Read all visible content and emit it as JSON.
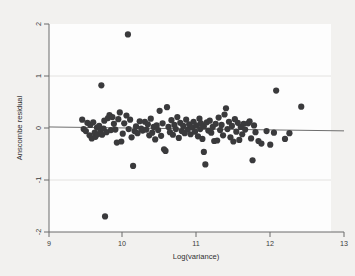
{
  "chart_data": {
    "type": "scatter",
    "title": "",
    "subtitle": "",
    "xlabel": "Log(variance)",
    "ylabel": "Anscombe residual",
    "xlim": [
      9,
      13
    ],
    "ylim": [
      -2,
      2
    ],
    "xticks": [
      9,
      10,
      11,
      12,
      13
    ],
    "xtick_labels": [
      "9",
      "10",
      "11",
      "12",
      "13"
    ],
    "yticks": [
      -2,
      -1,
      0,
      1,
      2
    ],
    "ytick_labels": [
      "-2",
      "-1",
      "0",
      "1",
      "2"
    ],
    "grid": "horizontal-faint",
    "legend": "none",
    "legend_position": "none",
    "marker": {
      "shape": "circle",
      "color": "#3a3a3c",
      "size": 3.1
    },
    "reference_line": {
      "type": "line",
      "color": "#6e6e6e",
      "x": [
        9.0,
        13.0
      ],
      "y": [
        0.02,
        -0.055
      ]
    },
    "series": [
      {
        "name": "Anscombe residuals",
        "n": 132,
        "points": [
          [
            9.45,
            0.16
          ],
          [
            9.47,
            -0.02
          ],
          [
            9.5,
            -0.06
          ],
          [
            9.52,
            0.1
          ],
          [
            9.55,
            -0.14
          ],
          [
            9.56,
            0.06
          ],
          [
            9.58,
            -0.2
          ],
          [
            9.6,
            0.11
          ],
          [
            9.62,
            -0.09
          ],
          [
            9.63,
            -0.17
          ],
          [
            9.65,
            0.01
          ],
          [
            9.66,
            -0.12
          ],
          [
            9.68,
            0.04
          ],
          [
            9.7,
            -0.05
          ],
          [
            9.71,
            0.82
          ],
          [
            9.72,
            -0.13
          ],
          [
            9.74,
            -0.01
          ],
          [
            9.75,
            0.14
          ],
          [
            9.76,
            -1.7
          ],
          [
            9.78,
            -0.08
          ],
          [
            9.8,
            0.19
          ],
          [
            9.82,
            0.25
          ],
          [
            9.84,
            -0.04
          ],
          [
            9.86,
            0.21
          ],
          [
            9.88,
            0.08
          ],
          [
            9.9,
            -0.03
          ],
          [
            9.92,
            -0.28
          ],
          [
            9.94,
            0.17
          ],
          [
            9.96,
            0.3
          ],
          [
            9.98,
            -0.26
          ],
          [
            10.0,
            -0.11
          ],
          [
            10.02,
            0.09
          ],
          [
            10.05,
            0.24
          ],
          [
            10.07,
            1.8
          ],
          [
            10.08,
            -0.02
          ],
          [
            10.1,
            0.16
          ],
          [
            10.12,
            -0.18
          ],
          [
            10.14,
            -0.73
          ],
          [
            10.16,
            -0.06
          ],
          [
            10.18,
            0.03
          ],
          [
            10.2,
            -0.1
          ],
          [
            10.23,
            0.13
          ],
          [
            10.25,
            -0.01
          ],
          [
            10.27,
            -0.05
          ],
          [
            10.3,
            0.12
          ],
          [
            10.32,
            -0.03
          ],
          [
            10.34,
            0.07
          ],
          [
            10.36,
            -0.14
          ],
          [
            10.38,
            0.18
          ],
          [
            10.4,
            -0.09
          ],
          [
            10.42,
            0.02
          ],
          [
            10.44,
            -0.22
          ],
          [
            10.46,
            0.05
          ],
          [
            10.48,
            -0.04
          ],
          [
            10.5,
            0.33
          ],
          [
            10.52,
            -0.15
          ],
          [
            10.54,
            0.09
          ],
          [
            10.56,
            -0.41
          ],
          [
            10.58,
            -0.44
          ],
          [
            10.6,
            0.4
          ],
          [
            10.62,
            0.02
          ],
          [
            10.64,
            -0.08
          ],
          [
            10.66,
            0.15
          ],
          [
            10.68,
            -0.13
          ],
          [
            10.7,
            0.06
          ],
          [
            10.72,
            -0.02
          ],
          [
            10.74,
            0.21
          ],
          [
            10.76,
            -0.19
          ],
          [
            10.78,
            0.1
          ],
          [
            10.8,
            -0.06
          ],
          [
            10.82,
            0.04
          ],
          [
            10.84,
            -0.1
          ],
          [
            10.86,
            0.16
          ],
          [
            10.88,
            -0.03
          ],
          [
            10.9,
            0.07
          ],
          [
            10.92,
            -0.12
          ],
          [
            10.94,
            0.01
          ],
          [
            10.96,
            0.12
          ],
          [
            10.98,
            -0.07
          ],
          [
            11.0,
            0.05
          ],
          [
            11.02,
            -0.16
          ],
          [
            11.04,
            0.18
          ],
          [
            11.05,
            -0.02
          ],
          [
            11.06,
            0.09
          ],
          [
            11.08,
            -0.21
          ],
          [
            11.1,
            0.03
          ],
          [
            11.1,
            -0.46
          ],
          [
            11.12,
            -0.7
          ],
          [
            11.14,
            0.11
          ],
          [
            11.16,
            -0.05
          ],
          [
            11.18,
            0.14
          ],
          [
            11.2,
            -0.09
          ],
          [
            11.22,
            0.02
          ],
          [
            11.24,
            -0.25
          ],
          [
            11.26,
            0.08
          ],
          [
            11.28,
            -0.24
          ],
          [
            11.3,
            0.2
          ],
          [
            11.32,
            -0.04
          ],
          [
            11.34,
            0.06
          ],
          [
            11.36,
            -0.14
          ],
          [
            11.38,
            0.26
          ],
          [
            11.4,
            0.38
          ],
          [
            11.42,
            -0.02
          ],
          [
            11.44,
            0.12
          ],
          [
            11.46,
            -0.18
          ],
          [
            11.48,
            0.04
          ],
          [
            11.5,
            -0.26
          ],
          [
            11.52,
            0.17
          ],
          [
            11.54,
            -0.07
          ],
          [
            11.56,
            0.1
          ],
          [
            11.58,
            -0.23
          ],
          [
            11.6,
            0.02
          ],
          [
            11.62,
            -0.12
          ],
          [
            11.64,
            0.08
          ],
          [
            11.66,
            -0.03
          ],
          [
            11.7,
            0.09
          ],
          [
            11.72,
            0.13
          ],
          [
            11.74,
            -0.2
          ],
          [
            11.76,
            -0.62
          ],
          [
            11.78,
            0.05
          ],
          [
            11.8,
            -0.08
          ],
          [
            11.84,
            -0.25
          ],
          [
            11.88,
            -0.3
          ],
          [
            11.95,
            -0.06
          ],
          [
            12.0,
            -0.32
          ],
          [
            12.05,
            -0.09
          ],
          [
            12.08,
            0.72
          ],
          [
            12.2,
            -0.21
          ],
          [
            12.26,
            -0.1
          ],
          [
            12.42,
            0.41
          ]
        ]
      }
    ]
  },
  "figure": {
    "background_color": "#f2f1ef",
    "plot_background_color": "#fdfdfd",
    "axis_color": "#6b6b6b",
    "point_color": "#3a3a3c"
  }
}
